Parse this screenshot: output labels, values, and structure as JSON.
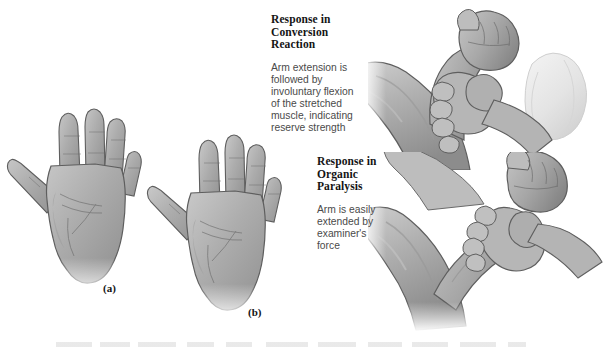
{
  "figure": {
    "background_color": "#ffffff",
    "ink_color": "#141414",
    "body_text_color": "#4a4a4a",
    "skin_tone_mid": "#a9a9a9",
    "skin_tone_light": "#c9c9c9",
    "skin_tone_shadow": "#8a8a8a",
    "outline_color": "#5e5e5e",
    "sleeve_color": "#ececec"
  },
  "callouts": [
    {
      "id": "conversion",
      "heading": "Response in\nConversion\nReaction",
      "body": "Arm extension is\nfollowed by\ninvoluntary flexion\nof the stretched\nmuscle, indicating\nreserve strength"
    },
    {
      "id": "organic",
      "heading": "Response in\nOrganic\nParalysis",
      "body": "Arm is easily\nextended by\nexaminer's\nforce"
    }
  ],
  "panel_labels": [
    {
      "id": "a",
      "text": "(a)"
    },
    {
      "id": "b",
      "text": "(b)"
    }
  ],
  "illustrations": [
    {
      "id": "hand-a",
      "name": "open-hand-palm-spread-fingers-left",
      "description": "Grayscale drawing of an open right hand, palm forward, fingers spread"
    },
    {
      "id": "hand-b",
      "name": "open-hand-palm-spread-fingers-right",
      "description": "Grayscale drawing of a second open hand, palm forward, fingers spread"
    },
    {
      "id": "arm-conversion",
      "name": "examiner-gripping-flexed-forearm-upper",
      "description": "Examiner's hand gripping a patient's flexed forearm at the wrist, patient's fist clenched, examiner's sleeve cuff visible at right"
    },
    {
      "id": "arm-organic",
      "name": "examiner-gripping-extended-forearm-lower",
      "description": "Examiner's hand gripping a patient's extended forearm at the wrist, patient's fist clenched"
    }
  ]
}
